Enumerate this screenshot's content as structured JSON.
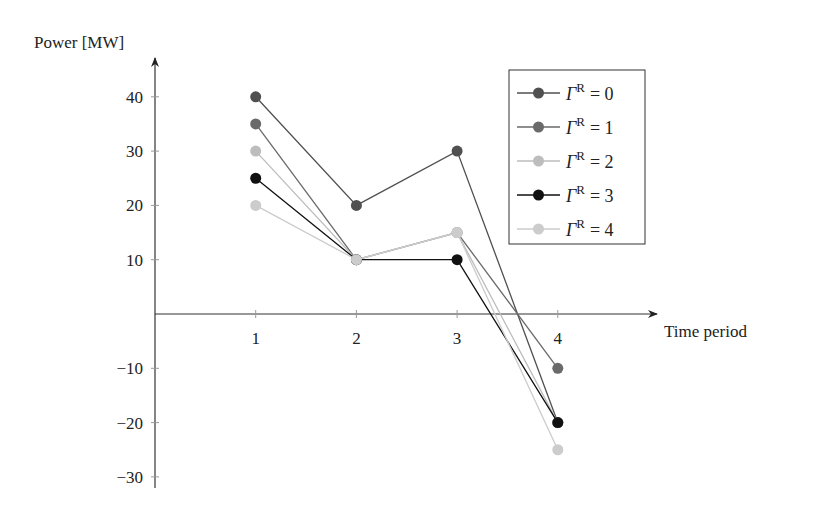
{
  "chart_data": {
    "type": "line",
    "title": "",
    "xlabel": "Time period",
    "ylabel": "Power [MW]",
    "x": [
      1,
      2,
      3,
      4
    ],
    "categories": [
      "1",
      "2",
      "3",
      "4"
    ],
    "yticks": [
      -30,
      -20,
      -10,
      10,
      20,
      30,
      40
    ],
    "ytick_labels": [
      "−30",
      "−20",
      "−10",
      "10",
      "20",
      "30",
      "40"
    ],
    "ylim": [
      -32,
      47
    ],
    "xlim": [
      0,
      5
    ],
    "grid": false,
    "legend_position": "upper right",
    "series": [
      {
        "name": "ΓR = 0",
        "legend_label": "= 0",
        "color": "#505050",
        "values": [
          40,
          20,
          30,
          -20
        ]
      },
      {
        "name": "ΓR = 1",
        "legend_label": "= 1",
        "color": "#6a6a6a",
        "values": [
          35,
          10,
          15,
          -10
        ]
      },
      {
        "name": "ΓR = 2",
        "legend_label": "= 2",
        "color": "#bdbdbd",
        "values": [
          30,
          10,
          15,
          -20
        ]
      },
      {
        "name": "ΓR = 3",
        "legend_label": "= 3",
        "color": "#111111",
        "values": [
          25,
          10,
          10,
          -20
        ]
      },
      {
        "name": "ΓR = 4",
        "legend_label": "= 4",
        "color": "#cccccc",
        "values": [
          20,
          10,
          15,
          -25
        ]
      }
    ]
  }
}
